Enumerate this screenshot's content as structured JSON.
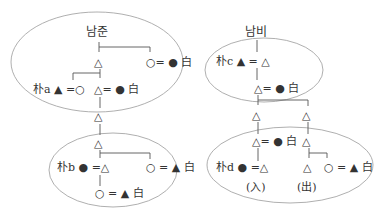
{
  "diagram": {
    "type": "kinship-chart",
    "colors": {
      "line": "#555555",
      "ellipse": "#9a9a9a",
      "text": "#333333"
    },
    "left_tree": {
      "title": "남준",
      "nodes": [
        {
          "id": "L1",
          "label": "△"
        },
        {
          "id": "L1w",
          "label": "○= ● 白"
        },
        {
          "id": "La",
          "label": "朴a ▲ =○"
        },
        {
          "id": "L2",
          "label": "△= ● 白"
        },
        {
          "id": "L3",
          "label": "△"
        },
        {
          "id": "L4",
          "label": "△"
        },
        {
          "id": "Lb",
          "label": "朴b ● =△"
        },
        {
          "id": "L4w",
          "label": "○ = ▲ 白"
        },
        {
          "id": "L5",
          "label": "○ = ▲ 白"
        }
      ]
    },
    "right_tree": {
      "title": "남비",
      "nodes": [
        {
          "id": "Rc",
          "label": "朴c ▲ = △"
        },
        {
          "id": "R1",
          "label": "△= ● 白"
        },
        {
          "id": "R2a",
          "label": "△"
        },
        {
          "id": "R2b",
          "label": "△"
        },
        {
          "id": "R3a",
          "label": "△= ● 白"
        },
        {
          "id": "R3b",
          "label": "△"
        },
        {
          "id": "Rd",
          "label": "朴d ● =△"
        },
        {
          "id": "R4b",
          "label": "△"
        },
        {
          "id": "R4w",
          "label": "○ = ▲ 白"
        }
      ],
      "annotations": {
        "in": "(入)",
        "out": "(出)"
      }
    }
  }
}
